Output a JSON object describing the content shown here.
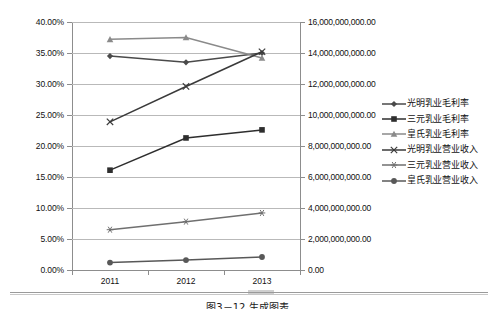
{
  "chart_data": {
    "type": "line",
    "title": "",
    "xlabel": "",
    "ylabel": "",
    "grid": true,
    "legend_position": "right",
    "categories": [
      "2011",
      "2012",
      "2013"
    ],
    "left_axis": {
      "label": "",
      "ylim": [
        0,
        0.4
      ],
      "tick_labels": [
        "40.00%",
        "35.00%",
        "30.00%",
        "25.00%",
        "20.00%",
        "15.00%",
        "10.00%",
        "5.00%",
        "0.00%"
      ],
      "tick_values": [
        0.4,
        0.35,
        0.3,
        0.25,
        0.2,
        0.15,
        0.1,
        0.05,
        0.0
      ]
    },
    "right_axis": {
      "label": "",
      "ylim": [
        0,
        16000000000
      ],
      "tick_labels": [
        "16,000,000,000.00",
        "14,000,000,000.00",
        "12,000,000,000.00",
        "10,000,000,000.00",
        "8,000,000,000.00",
        "6,000,000,000.00",
        "4,000,000,000.00",
        "2,000,000,000.00",
        "0.00"
      ],
      "tick_values": [
        16000000000,
        14000000000,
        12000000000,
        10000000000,
        8000000000,
        6000000000,
        4000000000,
        2000000000,
        0
      ]
    },
    "series": [
      {
        "name": "光明乳业毛利率",
        "axis": "left",
        "marker": "diamond",
        "color": "#4a4a4a",
        "values": [
          0.345,
          0.335,
          0.35
        ],
        "value_labels": [
          "34.50%",
          "33.50%",
          "35.00%"
        ]
      },
      {
        "name": "三元乳业毛利率",
        "axis": "left",
        "marker": "square",
        "color": "#2e2e2e",
        "values": [
          0.161,
          0.213,
          0.226
        ],
        "value_labels": [
          "16.10%",
          "21.30%",
          "22.60%"
        ]
      },
      {
        "name": "皇氏乳业毛利率",
        "axis": "left",
        "marker": "triangle",
        "color": "#8a8a8a",
        "values": [
          0.372,
          0.375,
          0.342
        ],
        "value_labels": [
          "37.20%",
          "37.50%",
          "34.20%"
        ]
      },
      {
        "name": "光明乳业营业收入",
        "axis": "right",
        "marker": "x",
        "color": "#3a3a3a",
        "values": [
          9560000000,
          11840000000,
          14080000000
        ],
        "value_labels": [
          "9,560,000,000.00",
          "11,840,000,000.00",
          "14,080,000,000.00"
        ]
      },
      {
        "name": "三元乳业营业收入",
        "axis": "right",
        "marker": "asterisk",
        "color": "#6f6f6f",
        "values": [
          2600000000,
          3120000000,
          3680000000
        ],
        "value_labels": [
          "2,600,000,000.00",
          "3,120,000,000.00",
          "3,680,000,000.00"
        ]
      },
      {
        "name": "皇氏乳业营业收入",
        "axis": "right",
        "marker": "circle",
        "color": "#585858",
        "values": [
          480000000,
          640000000,
          840000000
        ],
        "value_labels": [
          "480,000,000.00",
          "640,000,000.00",
          "840,000,000.00"
        ]
      }
    ]
  },
  "caption": {
    "text": "图3－12  生成图表"
  }
}
